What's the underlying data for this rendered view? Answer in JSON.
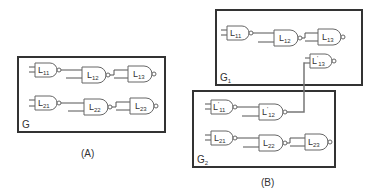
{
  "panels": {
    "A": {
      "caption": "(A)",
      "group_label": "G",
      "rows": [
        {
          "gates": [
            {
              "base": "L",
              "prime": "",
              "sub": "11"
            },
            {
              "base": "L",
              "prime": "",
              "sub": "12"
            },
            {
              "base": "L",
              "prime": "",
              "sub": "13"
            }
          ]
        },
        {
          "gates": [
            {
              "base": "L",
              "prime": "",
              "sub": "21"
            },
            {
              "base": "L",
              "prime": "",
              "sub": "22"
            },
            {
              "base": "L",
              "prime": "",
              "sub": "23"
            }
          ]
        }
      ]
    },
    "B": {
      "caption": "(B)",
      "g1": {
        "group_label": "G",
        "group_sub": "1",
        "row": [
          {
            "base": "L",
            "prime": "",
            "sub": "11"
          },
          {
            "base": "L",
            "prime": "",
            "sub": "12"
          },
          {
            "base": "L",
            "prime": "",
            "sub": "13"
          }
        ],
        "extra": {
          "base": "L",
          "prime": "'",
          "sub": "13"
        }
      },
      "g2": {
        "group_label": "G",
        "group_sub": "2",
        "row1": [
          {
            "base": "L",
            "prime": "'",
            "sub": "11"
          },
          {
            "base": "L",
            "prime": "'",
            "sub": "12"
          }
        ],
        "row2": [
          {
            "base": "L",
            "prime": "",
            "sub": "21"
          },
          {
            "base": "L",
            "prime": "",
            "sub": "22"
          },
          {
            "base": "L",
            "prime": "",
            "sub": "23"
          }
        ]
      }
    }
  },
  "colors": {
    "box_stroke": "#333333",
    "gate_stroke": "#666666",
    "connector": "#777777"
  }
}
